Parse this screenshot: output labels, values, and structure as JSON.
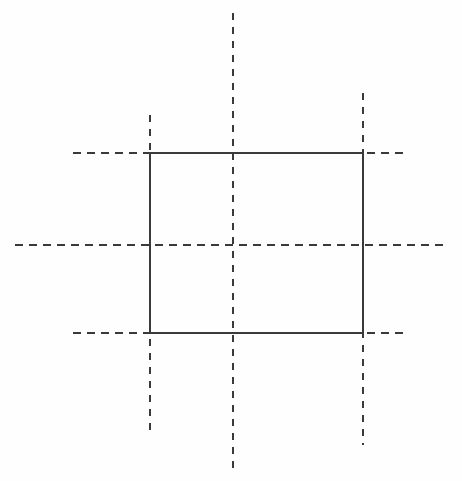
{
  "figure": {
    "background_color": "#fefefe",
    "line_color": "#3a3a3a",
    "canvas": {
      "width": 462,
      "height": 481
    }
  },
  "chart_data": {
    "type": "scatter",
    "xlabel": "",
    "ylabel": "",
    "xlim": [
      0,
      462
    ],
    "ylim": [
      0,
      481
    ],
    "grid": false,
    "legend": null,
    "rectangle": {
      "name": "solid-rectangle",
      "x_left": 150,
      "x_right": 363,
      "y_top": 153,
      "y_bottom": 333,
      "width": 213,
      "height": 180,
      "stroke": "#3a3a3a",
      "stroke_width": 1.15,
      "style": "solid",
      "fill": "none"
    },
    "corners": [
      {
        "name": "top-left",
        "x": 150,
        "y": 153
      },
      {
        "name": "top-right",
        "x": 363,
        "y": 153
      },
      {
        "name": "bottom-right",
        "x": 363,
        "y": 333
      },
      {
        "name": "bottom-left",
        "x": 150,
        "y": 333
      }
    ],
    "center_point": {
      "name": "center-crosshair",
      "x": 233,
      "y": 245
    },
    "horizontal_centerlines": [
      {
        "name": "top-centerline",
        "y": 153,
        "x_start": 73,
        "x_end": 405,
        "dash": "8 6",
        "stroke": "#3a3a3a"
      },
      {
        "name": "middle-centerline",
        "y": 245,
        "x_start": 15,
        "x_end": 448,
        "dash": "8 6",
        "stroke": "#3a3a3a"
      },
      {
        "name": "bottom-centerline",
        "y": 333,
        "x_start": 73,
        "x_end": 405,
        "dash": "8 6",
        "stroke": "#3a3a3a"
      }
    ],
    "vertical_centerlines": [
      {
        "name": "left-centerline",
        "x": 150,
        "y_start": 115,
        "y_end": 432,
        "dash": "7 7",
        "stroke": "#3a3a3a"
      },
      {
        "name": "middle-centerline",
        "x": 233,
        "y_start": 13,
        "y_end": 470,
        "dash": "7 7",
        "stroke": "#3a3a3a"
      },
      {
        "name": "right-centerline",
        "x": 363,
        "y_start": 93,
        "y_end": 445,
        "dash": "7 7",
        "stroke": "#3a3a3a"
      }
    ]
  }
}
